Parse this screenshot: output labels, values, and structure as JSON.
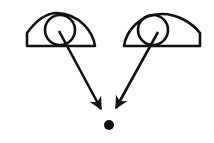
{
  "diagram": {
    "colors": {
      "stroke": "#111111",
      "background": "#ffffff"
    },
    "elements": [
      {
        "type": "eye",
        "id": "left-eye",
        "pupil_center": [
          60,
          30
        ]
      },
      {
        "type": "eye",
        "id": "right-eye",
        "pupil_center": [
          152,
          30
        ]
      },
      {
        "type": "arrow",
        "from": "left-eye",
        "to": [
          101,
          109
        ]
      },
      {
        "type": "arrow",
        "from": "right-eye",
        "to": [
          116,
          108
        ]
      },
      {
        "type": "dot",
        "id": "focus-point",
        "center": [
          109,
          125
        ]
      }
    ]
  }
}
